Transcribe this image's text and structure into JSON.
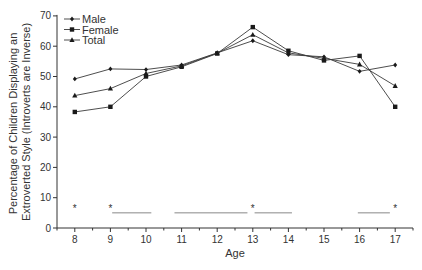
{
  "chart_data": {
    "type": "line",
    "title": "",
    "xlabel": "Age",
    "ylabel_lines": [
      "Percentage of Children Displaying an",
      "Extroverted Style (Introverts are Inverse)"
    ],
    "ylabel": "Percentage of Children Displaying an Extroverted Style (Introverts are Inverse)",
    "x": [
      8,
      9,
      10,
      11,
      12,
      13,
      14,
      15,
      16,
      17
    ],
    "xlim": [
      7.5,
      17.5
    ],
    "ylim": [
      0,
      70
    ],
    "yticks": [
      0,
      10,
      20,
      30,
      40,
      50,
      60,
      70
    ],
    "xticks": [
      8,
      9,
      10,
      11,
      12,
      13,
      14,
      15,
      16,
      17
    ],
    "grid": false,
    "legend_position": "upper-left",
    "series": [
      {
        "name": "Male",
        "marker": "diamond",
        "values": [
          49.2,
          52.5,
          52.3,
          53.8,
          57.8,
          61.8,
          57.2,
          56.5,
          51.7,
          53.8
        ]
      },
      {
        "name": "Female",
        "marker": "square",
        "values": [
          38.3,
          40.0,
          50.0,
          53.2,
          57.6,
          66.3,
          58.5,
          55.3,
          56.8,
          40.0
        ]
      },
      {
        "name": "Total",
        "marker": "triangle",
        "values": [
          43.7,
          46.0,
          51.0,
          53.5,
          57.7,
          63.8,
          57.8,
          56.0,
          54.0,
          46.9
        ]
      }
    ],
    "annotations": {
      "significance_asterisks": [
        {
          "x": 8,
          "y": 7,
          "label": "*"
        },
        {
          "x": 9,
          "y": 7,
          "label": "*"
        },
        {
          "x": 13,
          "y": 7,
          "label": "*"
        },
        {
          "x": 17,
          "y": 7,
          "label": "*"
        }
      ],
      "significance_lines": [
        {
          "x_start": 9.05,
          "x_end": 10.15,
          "y": 5
        },
        {
          "x_start": 10.8,
          "x_end": 12.85,
          "y": 5
        },
        {
          "x_start": 13.05,
          "x_end": 14.1,
          "y": 5
        },
        {
          "x_start": 15.95,
          "x_end": 16.85,
          "y": 5
        }
      ]
    }
  },
  "colors": {
    "line": "#3a3a3a",
    "marker": "#1a1a1a",
    "axis": "#333333",
    "sig_line": "#888888"
  }
}
